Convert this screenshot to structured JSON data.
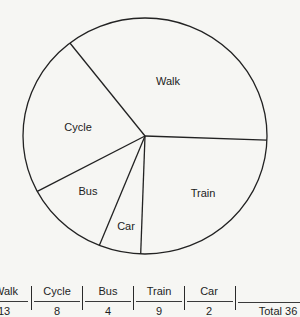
{
  "chart_data": {
    "type": "pie",
    "title": "",
    "start_angle_deg": 2,
    "direction": "clockwise",
    "categories": [
      "Train",
      "Car",
      "Bus",
      "Cycle",
      "Walk"
    ],
    "angles_deg": [
      90,
      20,
      40,
      80,
      130
    ],
    "values": [
      9,
      2,
      4,
      8,
      13
    ],
    "total": 36,
    "legend": "none (labels inside slices)"
  },
  "labels": {
    "walk": "Walk",
    "cycle": "Cycle",
    "bus": "Bus",
    "train": "Train",
    "car": "Car"
  },
  "table": {
    "headers": [
      "Walk",
      "Cycle",
      "Bus",
      "Train",
      "Car"
    ],
    "values_row_partial": [
      "13",
      "8",
      "4",
      "9",
      "2"
    ],
    "total_label": "Total 36"
  },
  "colors": {
    "background": "#f6f6f3",
    "line": "#222222",
    "text": "#1e1e1e"
  }
}
